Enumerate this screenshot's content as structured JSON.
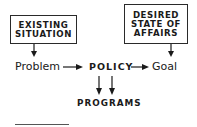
{
  "diagram": {
    "boxes": {
      "existing_situation": "EXISTING\nSITUATION",
      "desired_state": "DESIRED\nSTATE OF\nAFFAIRS"
    },
    "nodes": {
      "problem": "Problem",
      "policy": "POLICY",
      "goal": "Goal",
      "programs": "PROGRAMS"
    },
    "edges": [
      {
        "from": "EXISTING SITUATION",
        "to": "Problem"
      },
      {
        "from": "DESIRED STATE OF AFFAIRS",
        "to": "Goal"
      },
      {
        "from": "Problem",
        "to": "POLICY"
      },
      {
        "from": "POLICY",
        "to": "Goal"
      },
      {
        "from": "POLICY",
        "to": "PROGRAMS",
        "count": 2
      }
    ],
    "colors": {
      "ink": "#1a1a1a",
      "background": "#ffffff"
    }
  }
}
